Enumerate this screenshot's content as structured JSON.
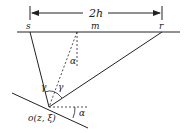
{
  "diagram": {
    "offset_label": "2h",
    "source_label": "s",
    "midpoint_label": "m",
    "receiver_label": "r",
    "dip_angle_top_label": "α",
    "dip_angle_bottom_label": "α",
    "incidence_angle_left_label": "γ",
    "incidence_angle_right_label": "γ",
    "reflection_point_label": "o(z, ξ)"
  },
  "colors": {
    "line": "#222222",
    "background": "#ffffff"
  }
}
